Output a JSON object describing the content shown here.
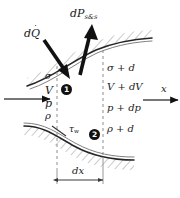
{
  "figure": {
    "background_color": "#ffffff",
    "ink_color": "#1a1a1a",
    "wall_color": "#262626",
    "hatch_color": "#9a9a9a",
    "dashed_color": "#8c8c8c",
    "arrow_color": "#111111"
  },
  "labels": {
    "power": {
      "prefix": "d",
      "symbol": "P",
      "subscript": "s&s"
    },
    "heat": {
      "prefix": "d",
      "symbol": "Q",
      "accent": "dot"
    },
    "wall_shear": {
      "symbol": "τ",
      "subscript": "w"
    },
    "axis_x": "x",
    "length": "dx"
  },
  "inlet_state": {
    "station": "1",
    "items": [
      {
        "text": "σ"
      },
      {
        "text": "V"
      },
      {
        "text": "p"
      },
      {
        "text": "ρ"
      }
    ]
  },
  "outlet_state": {
    "station": "2",
    "items": [
      {
        "text": "σ + d"
      },
      {
        "text": "V + dV"
      },
      {
        "text": "p + dp"
      },
      {
        "text": "ρ + d"
      }
    ]
  }
}
